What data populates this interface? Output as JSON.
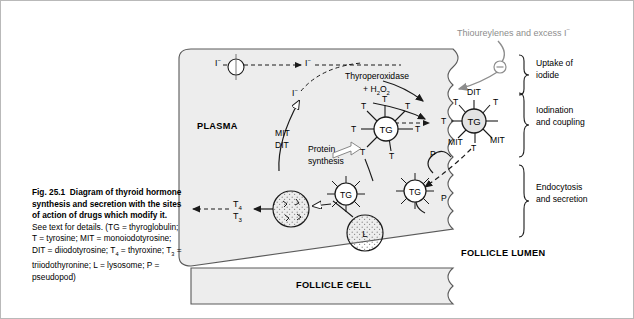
{
  "figure": {
    "number": "Fig. 25.1",
    "title_bold": "Diagram of thyroid hormone synthesis and secretion with the sites of action of drugs which modify it.",
    "body": "See text for details. (TG = thyroglobulin; T = tyrosine; MIT = monoiodotyrosine; DIT = diiodotyrosine; T4 = thyroxine; T3 = triiodothyronine; L = lysosome; P = pseudopod)",
    "legend_lines": [
      "See text for details. (TG = thyroglobulin;",
      "T = tyrosine; MIT = monoiodotyrosine;",
      "DIT = diiodotyrosine; T4 = thyroxine;",
      "T3 = triiodothyronine; L = lysosome;",
      "P = pseudopod)"
    ]
  },
  "drug_label": {
    "text": "Thioureylenes and excess I",
    "superscript": "−",
    "color": "#8d8d8d",
    "inhibition_symbol": "−"
  },
  "compartments": {
    "plasma": "PLASMA",
    "follicle_cell": "FOLLICLE CELL",
    "follicle_lumen": "FOLLICLE LUMEN"
  },
  "brackets": [
    {
      "label_line1": "Uptake of",
      "label_line2": "iodide"
    },
    {
      "label_line1": "Iodination",
      "label_line2": "and coupling"
    },
    {
      "label_line1": "Endocytosis",
      "label_line2": "and secretion"
    }
  ],
  "process_labels": {
    "thyroperoxidase": "Thyroperoxidase",
    "peroxide": "+ H2O2",
    "protein_synthesis_line1": "Protein",
    "protein_synthesis_line2": "synthesis",
    "mit": "MIT",
    "dit": "DIT"
  },
  "species": {
    "iodide": "I",
    "iodide_charge": "−",
    "tyrosine": "T",
    "thyroglobulin": "TG",
    "lysosome": "L",
    "pseudopod": "P",
    "mit": "MIT",
    "dit": "DIT",
    "t4": "T",
    "t4_sub": "4",
    "t3": "T",
    "t3_sub": "3"
  },
  "colors": {
    "cell_fill": "#ededed",
    "stroke": "#1a1a1a",
    "drug_gray": "#8d8d8d",
    "border": "#b9b9b9"
  }
}
